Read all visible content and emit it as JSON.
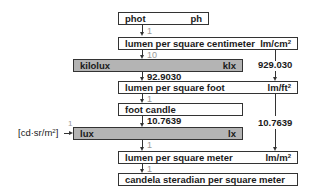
{
  "diagram": {
    "units": [
      {
        "id": "phot",
        "name": "phot",
        "symbol": "ph",
        "highlighted": false
      },
      {
        "id": "lm_cm2",
        "name": "lumen per square centimeter",
        "symbol_base": "lm/cm",
        "symbol_exp": "2",
        "highlighted": false
      },
      {
        "id": "kilolux",
        "name": "kilolux",
        "symbol": "klx",
        "highlighted": true
      },
      {
        "id": "lm_ft2",
        "name": "lumen per square foot",
        "symbol_base": "lm/ft",
        "symbol_exp": "2",
        "highlighted": false
      },
      {
        "id": "foot_candle",
        "name": "foot candle",
        "symbol": "",
        "highlighted": false
      },
      {
        "id": "lux",
        "name": "lux",
        "symbol": "lx",
        "highlighted": true
      },
      {
        "id": "lm_m2",
        "name": "lumen per square meter",
        "symbol_base": "lm/m",
        "symbol_exp": "2",
        "highlighted": false
      },
      {
        "id": "cd_sr_m2",
        "name": "candela steradian per square meter",
        "symbol": "",
        "highlighted": false
      }
    ],
    "conversions": [
      {
        "from": "phot",
        "to": "lm_cm2",
        "factor": "1",
        "style": "light"
      },
      {
        "from": "lm_cm2",
        "to": "kilolux",
        "factor": "10",
        "style": "light"
      },
      {
        "from": "kilolux",
        "to": "lm_ft2",
        "factor": "92.9030",
        "style": "bold"
      },
      {
        "from": "lm_ft2",
        "to": "foot_candle",
        "factor": "1",
        "style": "light"
      },
      {
        "from": "foot_candle",
        "to": "lux",
        "factor": "10.7639",
        "style": "bold"
      },
      {
        "from": "lux",
        "to": "lm_m2",
        "factor": "1",
        "style": "light"
      },
      {
        "from": "lm_m2",
        "to": "cd_sr_m2",
        "factor": "1",
        "style": "light"
      },
      {
        "from": "lm_cm2",
        "to": "lm_ft2",
        "factor": "929.030",
        "style": "bold",
        "side": "right"
      },
      {
        "from": "lm_ft2",
        "to": "lm_m2",
        "factor": "10.7639",
        "style": "bold",
        "side": "right"
      },
      {
        "from": "cd_sr_m2_bracket",
        "to": "lux",
        "factor": "1",
        "style": "light",
        "side": "left"
      }
    ],
    "bracket_label": {
      "base": "cd·sr/m",
      "exp": "2"
    },
    "colors": {
      "box_border": "#333333",
      "highlight_fill": "#b4b4b4",
      "light_factor": "#999999"
    }
  }
}
